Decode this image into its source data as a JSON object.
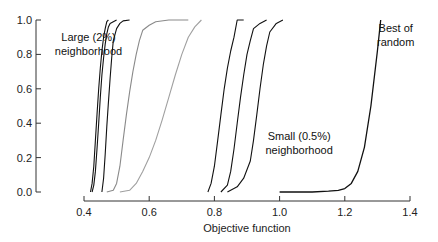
{
  "chart_data": {
    "type": "line",
    "title": "",
    "xlabel": "Objective function",
    "ylabel": "",
    "xlim": [
      0.4,
      1.4
    ],
    "ylim": [
      0.0,
      1.0
    ],
    "xticks": [
      "0.4",
      "0.6",
      "0.8",
      "1.0",
      "1.2",
      "1.4"
    ],
    "yticks": [
      "0.0",
      "0.2",
      "0.4",
      "0.6",
      "0.8",
      "1.0"
    ],
    "grid": false,
    "legend": null,
    "annotations": [
      {
        "text": [
          "Large (2%)",
          "neighborhood"
        ],
        "x": 0.42,
        "y": 0.88
      },
      {
        "text": [
          "Small (0.5%)",
          "neighborhood"
        ],
        "x": 1.06,
        "y": 0.3
      },
      {
        "text": [
          "Best of",
          "random"
        ],
        "x": 1.35,
        "y": 0.93
      }
    ],
    "series": [
      {
        "name": "Large neighborhood run 1",
        "group": "large",
        "color": "#111111",
        "x": [
          0.42,
          0.425,
          0.43,
          0.435,
          0.44,
          0.445,
          0.45,
          0.455,
          0.46,
          0.465,
          0.47,
          0.475
        ],
        "y": [
          0.0,
          0.05,
          0.15,
          0.3,
          0.45,
          0.6,
          0.72,
          0.82,
          0.9,
          0.95,
          0.99,
          1.0
        ]
      },
      {
        "name": "Large neighborhood run 2",
        "group": "large",
        "color": "#111111",
        "x": [
          0.425,
          0.43,
          0.435,
          0.44,
          0.445,
          0.45,
          0.455,
          0.46,
          0.465,
          0.47,
          0.475,
          0.48,
          0.49,
          0.5
        ],
        "y": [
          0.0,
          0.04,
          0.12,
          0.25,
          0.4,
          0.55,
          0.68,
          0.78,
          0.86,
          0.92,
          0.96,
          0.98,
          0.99,
          1.0
        ]
      },
      {
        "name": "Large neighborhood run 3",
        "group": "large",
        "color": "#111111",
        "x": [
          0.455,
          0.46,
          0.465,
          0.47,
          0.475,
          0.48,
          0.485,
          0.49,
          0.5,
          0.51,
          0.52,
          0.54
        ],
        "y": [
          0.0,
          0.08,
          0.22,
          0.38,
          0.52,
          0.66,
          0.78,
          0.88,
          0.95,
          0.98,
          0.995,
          1.0
        ]
      },
      {
        "name": "Large neighborhood run 4",
        "group": "large-gray",
        "color": "#8a8a8a",
        "x": [
          0.47,
          0.49,
          0.5,
          0.51,
          0.52,
          0.53,
          0.54,
          0.55,
          0.56,
          0.57,
          0.58,
          0.6,
          0.62,
          0.66,
          0.72
        ],
        "y": [
          0.0,
          0.01,
          0.05,
          0.15,
          0.3,
          0.45,
          0.58,
          0.7,
          0.8,
          0.88,
          0.94,
          0.97,
          0.99,
          1.0,
          1.0
        ]
      },
      {
        "name": "Large neighborhood run 5",
        "group": "large-gray",
        "color": "#a0a0a0",
        "x": [
          0.51,
          0.54,
          0.56,
          0.58,
          0.6,
          0.62,
          0.64,
          0.66,
          0.68,
          0.7,
          0.72,
          0.74,
          0.76
        ],
        "y": [
          0.0,
          0.01,
          0.05,
          0.12,
          0.2,
          0.3,
          0.42,
          0.55,
          0.68,
          0.8,
          0.9,
          0.96,
          1.0
        ]
      },
      {
        "name": "Small neighborhood run 1",
        "group": "small",
        "color": "#111111",
        "x": [
          0.78,
          0.79,
          0.8,
          0.81,
          0.82,
          0.83,
          0.84,
          0.85,
          0.86,
          0.87,
          0.89
        ],
        "y": [
          0.0,
          0.05,
          0.15,
          0.3,
          0.45,
          0.6,
          0.72,
          0.82,
          0.9,
          1.0,
          1.0
        ]
      },
      {
        "name": "Small neighborhood run 2",
        "group": "small",
        "color": "#111111",
        "x": [
          0.82,
          0.84,
          0.85,
          0.86,
          0.87,
          0.88,
          0.89,
          0.9,
          0.91,
          0.92,
          0.94,
          0.96
        ],
        "y": [
          0.0,
          0.04,
          0.12,
          0.25,
          0.4,
          0.55,
          0.68,
          0.8,
          0.88,
          0.95,
          0.98,
          1.0
        ]
      },
      {
        "name": "Small neighborhood run 3",
        "group": "small",
        "color": "#111111",
        "x": [
          0.84,
          0.87,
          0.89,
          0.91,
          0.92,
          0.93,
          0.94,
          0.95,
          0.96,
          0.97,
          0.99,
          1.01
        ],
        "y": [
          0.0,
          0.03,
          0.08,
          0.18,
          0.3,
          0.45,
          0.6,
          0.74,
          0.85,
          0.93,
          0.98,
          1.0
        ]
      },
      {
        "name": "Best of random",
        "group": "random",
        "color": "#111111",
        "x": [
          1.0,
          1.1,
          1.15,
          1.18,
          1.2,
          1.22,
          1.24,
          1.26,
          1.28,
          1.3,
          1.31
        ],
        "y": [
          0.0,
          0.0,
          0.005,
          0.01,
          0.02,
          0.05,
          0.12,
          0.26,
          0.5,
          0.82,
          1.0
        ]
      }
    ]
  }
}
